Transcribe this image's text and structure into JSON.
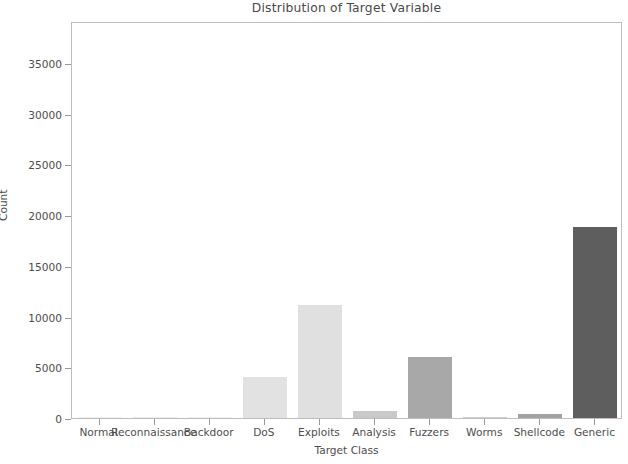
{
  "chart_data": {
    "type": "bar",
    "title": "Distribution of Target Variable",
    "xlabel": "Target Class",
    "ylabel": "Count",
    "categories": [
      "Normal",
      "Reconnaissance",
      "Backdoor",
      "DoS",
      "Exploits",
      "Analysis",
      "Fuzzers",
      "Worms",
      "Shellcode",
      "Generic"
    ],
    "values": [
      60,
      130,
      90,
      4050,
      11150,
      700,
      6000,
      50,
      400,
      18850
    ],
    "bar_colors": [
      "#f0f0f0",
      "#ececec",
      "#f0f0f0",
      "#e2e2e2",
      "#e0e0e0",
      "#c9c9c9",
      "#a8a8a8",
      "#cfcfcf",
      "#a2a2a2",
      "#5e5e5e"
    ],
    "ylim": [
      0,
      39150
    ],
    "xlim": [
      -0.5,
      9.5
    ],
    "yticks": [
      0,
      5000,
      10000,
      15000,
      20000,
      25000,
      30000,
      35000
    ],
    "ytick_labels": [
      "0",
      "5000",
      "10000",
      "15000",
      "20000",
      "25000",
      "30000",
      "35000"
    ],
    "grid": false,
    "legend": null,
    "bar_width_ratio": 0.8,
    "axes_color": "#bdbdbd"
  }
}
